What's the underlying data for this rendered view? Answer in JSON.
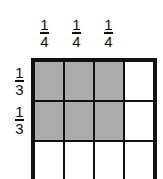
{
  "top_fractions": [
    {
      "numerator": "1",
      "denominator": "4"
    },
    {
      "numerator": "1",
      "denominator": "4"
    },
    {
      "numerator": "1",
      "denominator": "4"
    }
  ],
  "side_fractions": [
    {
      "numerator": "1",
      "denominator": "3"
    },
    {
      "numerator": "1",
      "denominator": "3"
    }
  ],
  "grid": {
    "rows": 3,
    "cols": 4,
    "shaded": [
      [
        1,
        1,
        1,
        0
      ],
      [
        1,
        1,
        1,
        0
      ],
      [
        0,
        0,
        0,
        0
      ]
    ],
    "shade_color": "#c9c9c9"
  }
}
